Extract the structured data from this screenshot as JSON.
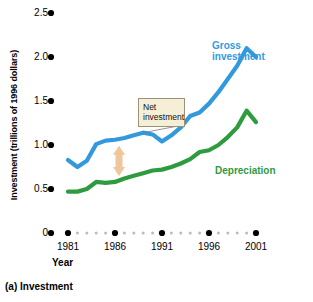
{
  "figure": {
    "caption": "(a) Investment",
    "callout": {
      "line1": "Net",
      "line2": "investment"
    }
  },
  "chart_data": {
    "type": "line",
    "title": "",
    "xlabel": "Year",
    "ylabel": "Investment (trillions of 1996 dollars)",
    "xlim": [
      1980,
      2001
    ],
    "ylim": [
      0,
      2.5
    ],
    "xticks": [
      1981,
      1986,
      1991,
      1996,
      2001
    ],
    "xtick_labels": [
      "1981",
      "1986",
      "1991",
      "1996",
      "2001"
    ],
    "yticks": [
      0,
      0.5,
      1.0,
      1.5,
      2.0,
      2.5
    ],
    "ytick_labels": [
      "0",
      "0.5",
      "1.0",
      "1.5",
      "2.0",
      "2.5"
    ],
    "grid": false,
    "legend": "inline-annotations",
    "colors": {
      "gross_investment": "#3399DD",
      "depreciation": "#2E9B3E",
      "net_investment_arrow": "#EEC79A",
      "callout_background": "#F6EFD8",
      "callout_border": "#9B9378",
      "axis_dots": "#000000",
      "minor_dots": "#BBBBBB"
    },
    "x": [
      1981,
      1982,
      1983,
      1984,
      1985,
      1986,
      1987,
      1988,
      1989,
      1990,
      1991,
      1992,
      1993,
      1994,
      1995,
      1996,
      1997,
      1998,
      1999,
      2000,
      2001
    ],
    "series": [
      {
        "name": "Gross investment",
        "values": [
          0.83,
          0.75,
          0.82,
          1.01,
          1.05,
          1.06,
          1.08,
          1.11,
          1.14,
          1.12,
          1.04,
          1.11,
          1.2,
          1.33,
          1.37,
          1.47,
          1.6,
          1.75,
          1.9,
          2.1,
          2.0
        ]
      },
      {
        "name": "Depreciation",
        "values": [
          0.47,
          0.47,
          0.5,
          0.58,
          0.57,
          0.58,
          0.62,
          0.65,
          0.68,
          0.71,
          0.72,
          0.75,
          0.79,
          0.84,
          0.92,
          0.94,
          1.0,
          1.09,
          1.2,
          1.39,
          1.26
        ]
      }
    ],
    "annotations": [
      {
        "name": "net-investment",
        "text": "Net investment",
        "type": "callout-with-arrow",
        "points_to_x": 1989,
        "gap_marker_x": 1986,
        "gap_top": 1.06,
        "gap_bottom": 0.58
      },
      {
        "name": "gross-investment-label",
        "text": "Gross investment"
      },
      {
        "name": "depreciation-label",
        "text": "Depreciation"
      }
    ]
  }
}
